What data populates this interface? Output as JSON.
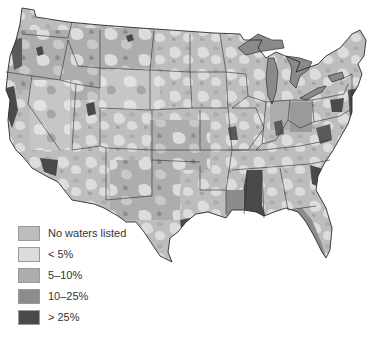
{
  "map": {
    "subject": "Contiguous United States — percentage of waters listed (by watershed)",
    "fill_colors": {
      "none": "#bdbdbd",
      "lt5": "#dcdcdc",
      "5to10": "#adadad",
      "10to25": "#8c8c8c",
      "gt25": "#4a4a4a",
      "lakes": "#8a8a8a",
      "borders": "#2e2e2e",
      "background": "#ffffff"
    }
  },
  "legend": {
    "items": [
      {
        "label": "No waters listed",
        "color": "#bdbdbd"
      },
      {
        "label": "< 5%",
        "color": "#dcdcdc"
      },
      {
        "label": "5–10%",
        "color": "#adadad"
      },
      {
        "label": "10–25%",
        "color": "#8c8c8c"
      },
      {
        "label": "> 25%",
        "color": "#4a4a4a"
      }
    ]
  }
}
